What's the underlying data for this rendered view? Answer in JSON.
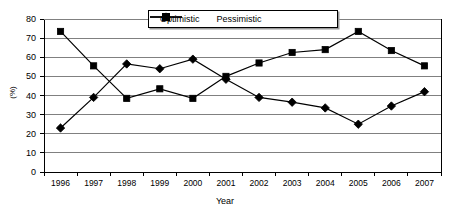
{
  "chart_data": {
    "type": "line",
    "title": "",
    "xlabel": "Year",
    "ylabel": "(%)",
    "categories": [
      "1996",
      "1997",
      "1998",
      "1999",
      "2000",
      "2001",
      "2002",
      "2003",
      "2004",
      "2005",
      "2006",
      "2007"
    ],
    "series": [
      {
        "name": "Optimistic",
        "marker": "diamond",
        "values": [
          23,
          39,
          56.5,
          54,
          59,
          48.5,
          39,
          36.5,
          33.5,
          25,
          34.5,
          42
        ]
      },
      {
        "name": "Pessimistic",
        "marker": "square",
        "values": [
          73.5,
          55.5,
          38.5,
          43.5,
          38.5,
          50,
          57,
          62.5,
          64,
          73.5,
          63.5,
          55.5
        ]
      }
    ],
    "ylim": [
      0,
      80
    ],
    "ytick_step": 10,
    "yticks": [
      "80",
      "70",
      "60",
      "50",
      "40",
      "30",
      "20",
      "10",
      "0"
    ],
    "grid": "horizontal",
    "legend_position": "top-center",
    "colors": {
      "line": "#000000",
      "marker": "#000000",
      "grid": "#808080",
      "axis": "#000000",
      "background": "#ffffff"
    }
  },
  "legend": {
    "items": [
      {
        "label": "Optimistic"
      },
      {
        "label": "Pessimistic"
      }
    ]
  }
}
